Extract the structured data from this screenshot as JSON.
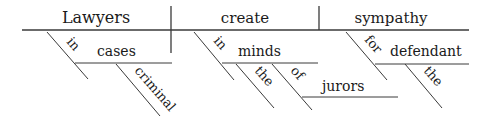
{
  "diagram": {
    "type": "sentence-diagram",
    "sentence": "Lawyers in criminal cases create sympathy in the minds of the jurors for the defendant",
    "baseline": {
      "subject": "Lawyers",
      "verb": "create",
      "object": "sympathy"
    },
    "modifiers": {
      "subject_prep": "in",
      "subject_prep_object": "cases",
      "subject_prep_object_adj": "criminal",
      "verb_prep": "in",
      "verb_prep_object": "minds",
      "verb_prep_object_article": "the",
      "nested_prep": "of",
      "nested_prep_object": "jurors",
      "object_prep": "for",
      "object_prep_object": "defendant",
      "object_prep_object_article": "the"
    }
  }
}
